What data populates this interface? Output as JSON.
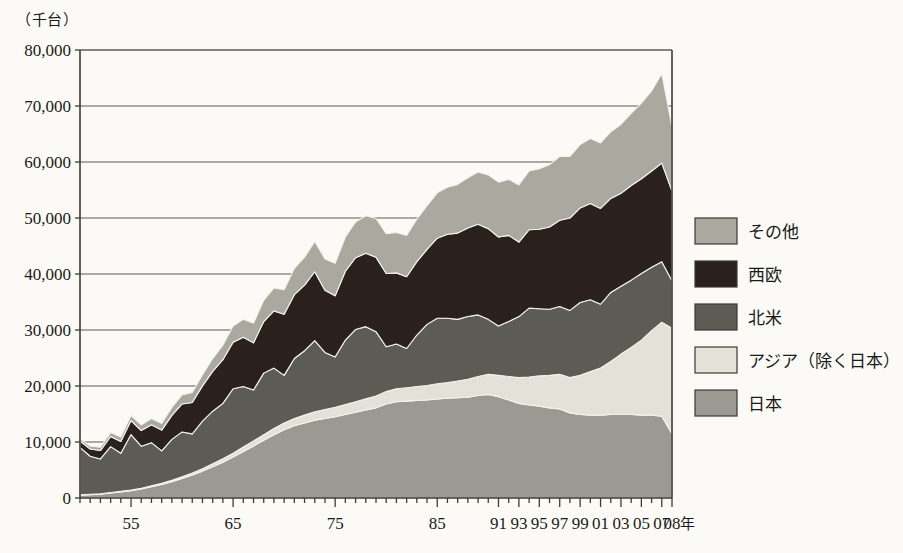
{
  "chart_data": {
    "type": "area",
    "stacked": true,
    "title": "",
    "xlabel": "年",
    "ylabel": "（千台）",
    "yunit_note": "（千台）",
    "ylim": [
      0,
      80000
    ],
    "ytick_values": [
      0,
      10000,
      20000,
      30000,
      40000,
      50000,
      60000,
      70000,
      80000
    ],
    "ytick_labels": [
      "0",
      "10,000",
      "20,000",
      "30,000",
      "40,000",
      "50,000",
      "60,000",
      "70,000",
      "80,000"
    ],
    "grid": true,
    "legend_position": "right",
    "x": [
      1950,
      1951,
      1952,
      1953,
      1954,
      1955,
      1956,
      1957,
      1958,
      1959,
      1960,
      1961,
      1962,
      1963,
      1964,
      1965,
      1966,
      1967,
      1968,
      1969,
      1970,
      1971,
      1972,
      1973,
      1974,
      1975,
      1976,
      1977,
      1978,
      1979,
      1980,
      1981,
      1982,
      1983,
      1984,
      1985,
      1986,
      1987,
      1988,
      1989,
      1990,
      1991,
      1992,
      1993,
      1994,
      1995,
      1996,
      1997,
      1998,
      1999,
      2000,
      2001,
      2002,
      2003,
      2004,
      2005,
      2006,
      2007,
      2008
    ],
    "xtick_labels": [
      "55",
      "65",
      "75",
      "85",
      "91",
      "93",
      "95",
      "97",
      "99",
      "01",
      "03",
      "05",
      "07",
      "08"
    ],
    "xtick_years": [
      1955,
      1965,
      1975,
      1985,
      1991,
      1993,
      1995,
      1997,
      1999,
      2001,
      2003,
      2005,
      2007,
      2008
    ],
    "xlabel_suffix": "年",
    "series": [
      {
        "name": "日本",
        "color": "#9a9a92",
        "values": [
          500,
          600,
          700,
          900,
          1100,
          1300,
          1600,
          2000,
          2400,
          2900,
          3500,
          4100,
          4800,
          5600,
          6400,
          7300,
          8300,
          9300,
          10300,
          11300,
          12200,
          12900,
          13400,
          13900,
          14200,
          14500,
          14900,
          15300,
          15700,
          16100,
          16800,
          17200,
          17300,
          17400,
          17500,
          17700,
          17800,
          17900,
          18000,
          18300,
          18500,
          18100,
          17500,
          16900,
          16600,
          16400,
          16100,
          15900,
          15200,
          14900,
          14800,
          14800,
          14900,
          14900,
          14900,
          14800,
          14800,
          14600,
          11500
        ],
        "value_at_start": 500,
        "value_at_end": 11500
      },
      {
        "name": "アジア（除く日本）",
        "color": "#e3e2d8",
        "values": [
          50,
          60,
          70,
          80,
          100,
          120,
          150,
          180,
          220,
          260,
          300,
          350,
          420,
          500,
          600,
          700,
          800,
          900,
          1000,
          1100,
          1200,
          1300,
          1400,
          1500,
          1600,
          1700,
          1800,
          1900,
          2000,
          2100,
          2200,
          2300,
          2400,
          2500,
          2600,
          2700,
          2800,
          3000,
          3200,
          3400,
          3600,
          3800,
          4200,
          4600,
          5000,
          5400,
          5800,
          6200,
          6300,
          7000,
          7800,
          8400,
          9500,
          10800,
          12000,
          13400,
          15100,
          16800,
          18800
        ],
        "value_at_start": 50,
        "value_at_end": 18800
      },
      {
        "name": "北米",
        "color": "#5c5b54",
        "values": [
          8500,
          6800,
          6200,
          8200,
          6800,
          9900,
          7500,
          7700,
          5800,
          7300,
          8000,
          7000,
          8500,
          9400,
          9900,
          11500,
          10800,
          9100,
          11000,
          10800,
          8500,
          10700,
          11500,
          12700,
          10200,
          9000,
          11500,
          12900,
          12900,
          11500,
          8000,
          8000,
          7000,
          9200,
          10900,
          11700,
          11500,
          11000,
          11200,
          11000,
          9800,
          8800,
          9800,
          10900,
          12300,
          12000,
          11800,
          12100,
          12000,
          13000,
          12800,
          11400,
          12300,
          12100,
          12000,
          11900,
          11300,
          10800,
          8500
        ]
      },
      {
        "name": "西欧",
        "color": "#2a211c",
        "values": [
          1100,
          1300,
          1500,
          1800,
          2100,
          2500,
          2800,
          3200,
          3700,
          4300,
          5000,
          5600,
          6300,
          7100,
          7800,
          8300,
          8800,
          8400,
          9200,
          10200,
          10900,
          11400,
          11700,
          12300,
          11100,
          10900,
          12300,
          12800,
          13100,
          13300,
          13100,
          12700,
          12800,
          13100,
          13400,
          14300,
          15000,
          15400,
          15800,
          16200,
          16200,
          15900,
          15400,
          13300,
          14000,
          14200,
          14700,
          15400,
          16500,
          16900,
          17200,
          17100,
          16800,
          16600,
          16900,
          16900,
          17200,
          17600,
          16000
        ]
      },
      {
        "name": "その他",
        "color": "#a9a9a0",
        "values": [
          400,
          500,
          600,
          700,
          800,
          900,
          1000,
          1100,
          1200,
          1400,
          1600,
          1800,
          2000,
          2300,
          2600,
          2900,
          3200,
          3500,
          3800,
          4100,
          4400,
          4700,
          5000,
          5400,
          5600,
          5800,
          6100,
          6400,
          6700,
          6900,
          7100,
          7200,
          7400,
          7600,
          7800,
          8100,
          8400,
          8700,
          9000,
          9300,
          9600,
          9800,
          10000,
          10200,
          10500,
          10800,
          11100,
          11400,
          11000,
          11300,
          11600,
          11700,
          11900,
          12300,
          12900,
          13500,
          14300,
          16000,
          11400
        ]
      }
    ],
    "totals_note": {
      "peak_year": 2007,
      "peak_value": 72000,
      "value_2008": 66000,
      "value_start": 10550
    }
  },
  "legend": {
    "items": [
      {
        "label": "その他",
        "color": "#a9a9a0"
      },
      {
        "label": "西欧",
        "color": "#2a211c"
      },
      {
        "label": "北米",
        "color": "#5c5b54"
      },
      {
        "label": "アジア（除く日本）",
        "color": "#e3e2d8"
      },
      {
        "label": "日本",
        "color": "#9a9a92"
      }
    ]
  },
  "axis": {
    "unit_top_left": "（千台）",
    "unit_bottom_right": "年"
  },
  "colors": {
    "background": "#fbfaf7",
    "axis": "#3d3c36",
    "grid": "#5d5b52",
    "text": "#1a1a18"
  }
}
